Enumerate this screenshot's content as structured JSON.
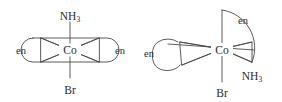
{
  "figure": {
    "name": "cobalt-ethylenediamine-isomers",
    "background_color": "#ffffff",
    "line_color": "#4a4a4a",
    "text_color": "#2b2b2b",
    "width": 282,
    "height": 102
  },
  "structures": [
    {
      "id": "trans-isomer",
      "position": "left",
      "center_atom": "Co",
      "axial_top_ligand": "NH",
      "axial_top_subscript": "3",
      "axial_bottom_ligand": "Br",
      "equatorial_left_ligand": "en",
      "equatorial_right_ligand": "en",
      "geometry": "octahedral"
    },
    {
      "id": "cis-isomer",
      "position": "right",
      "center_atom": "Co",
      "axial_top_ligand": "en",
      "axial_bottom_ligand": "Br",
      "equatorial_left_ligand": "en",
      "equatorial_right_ligand": "NH",
      "equatorial_right_subscript": "3",
      "geometry": "octahedral"
    }
  ]
}
